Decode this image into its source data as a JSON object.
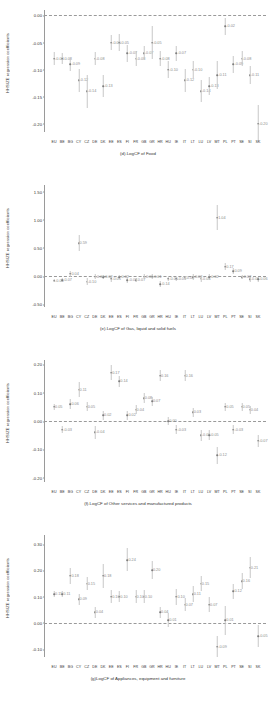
{
  "figure": {
    "ylabel": "HHSIZE regression coefficients",
    "countries": [
      "EU",
      "BE",
      "BG",
      "CY",
      "CZ",
      "DE",
      "DK",
      "EE",
      "ES",
      "FI",
      "FR",
      "GB",
      "GR",
      "HR",
      "HU",
      "IE",
      "IT",
      "LT",
      "LU",
      "LV",
      "MT",
      "PL",
      "PT",
      "SE",
      "SI",
      "SK"
    ]
  },
  "chart_data": [
    {
      "type": "scatter",
      "panel_id": "d",
      "title": "(d).LogCF of Food",
      "xlabel": "",
      "ylabel": "HHSIZE regression coefficients",
      "ylim": [
        -0.215,
        0.01
      ],
      "yticks": [
        "0.00",
        "-0.05",
        "-0.10",
        "-0.15",
        "-0.20"
      ],
      "ytickvals": [
        0.0,
        -0.05,
        -0.1,
        -0.15,
        -0.2
      ],
      "grid": false,
      "zero_reference": 0.0,
      "categories": [
        "EU",
        "BE",
        "BG",
        "CY",
        "CZ",
        "DE",
        "DK",
        "EE",
        "ES",
        "FI",
        "FR",
        "GB",
        "GR",
        "HR",
        "HU",
        "IE",
        "IT",
        "LT",
        "LU",
        "LV",
        "MT",
        "PL",
        "PT",
        "SE",
        "SI",
        "SK"
      ],
      "values": [
        -0.08,
        -0.08,
        -0.09,
        -0.12,
        -0.14,
        -0.08,
        -0.13,
        -0.05,
        -0.05,
        -0.07,
        -0.08,
        -0.07,
        -0.05,
        -0.08,
        -0.1,
        -0.07,
        -0.12,
        -0.1,
        -0.14,
        -0.13,
        -0.11,
        -0.02,
        -0.09,
        -0.08,
        -0.11,
        -0.2
      ],
      "errors": [
        0.012,
        0.01,
        0.012,
        0.022,
        0.03,
        0.012,
        0.02,
        0.014,
        0.016,
        0.016,
        0.014,
        0.013,
        0.03,
        0.014,
        0.016,
        0.014,
        0.022,
        0.016,
        0.02,
        0.016,
        0.026,
        0.016,
        0.016,
        0.014,
        0.016,
        0.034
      ]
    },
    {
      "type": "scatter",
      "panel_id": "e",
      "title": "(e).LogCF of Gas, liquid and solid fuels",
      "xlabel": "",
      "ylabel": "HHSIZE regression coefficients",
      "ylim": [
        -0.55,
        1.62
      ],
      "yticks": [
        "1.50",
        "1.00",
        "0.50",
        "0.00",
        "-0.50"
      ],
      "ytickvals": [
        1.5,
        1.0,
        0.5,
        0.0,
        -0.5
      ],
      "grid": false,
      "zero_reference": 0.0,
      "categories": [
        "EU",
        "BE",
        "BG",
        "CY",
        "CZ",
        "DE",
        "DK",
        "EE",
        "ES",
        "FI",
        "FR",
        "GB",
        "GR",
        "HR",
        "HU",
        "IE",
        "IT",
        "LT",
        "LU",
        "LV",
        "MT",
        "PL",
        "PT",
        "SE",
        "SI",
        "SK"
      ],
      "values": [
        -0.08,
        -0.07,
        0.04,
        0.59,
        -0.1,
        -0.01,
        -0.02,
        -0.05,
        -0.02,
        -0.07,
        -0.07,
        -0.01,
        -0.01,
        -0.14,
        -0.05,
        -0.05,
        -0.03,
        -0.02,
        -0.05,
        -0.02,
        1.04,
        0.17,
        0.09,
        -0.02,
        -0.06,
        -0.06
      ],
      "errors": [
        0.03,
        0.03,
        0.05,
        0.14,
        0.06,
        0.04,
        0.04,
        0.05,
        0.04,
        0.05,
        0.04,
        0.04,
        0.05,
        0.06,
        0.04,
        0.04,
        0.04,
        0.05,
        0.05,
        0.05,
        0.22,
        0.07,
        0.05,
        0.04,
        0.05,
        0.05
      ]
    },
    {
      "type": "scatter",
      "panel_id": "f",
      "title": "(f).LogCF of Other services and manufactured products",
      "xlabel": "",
      "ylabel": "HHSIZE regression coefficients",
      "ylim": [
        -0.215,
        0.215
      ],
      "yticks": [
        "0.20",
        "0.10",
        "0.00",
        "-0.10",
        "-0.20"
      ],
      "ytickvals": [
        0.2,
        0.1,
        0.0,
        -0.1,
        -0.2
      ],
      "grid": false,
      "zero_reference": 0.0,
      "categories": [
        "EU",
        "BE",
        "BG",
        "CY",
        "CZ",
        "DE",
        "DK",
        "EE",
        "ES",
        "FI",
        "FR",
        "GB",
        "GR",
        "HR",
        "HU",
        "IE",
        "IT",
        "LT",
        "LU",
        "LV",
        "MT",
        "PL",
        "PT",
        "SE",
        "SI",
        "SK"
      ],
      "values": [
        0.05,
        -0.03,
        0.06,
        0.11,
        0.05,
        -0.04,
        0.02,
        0.17,
        0.14,
        0.02,
        0.04,
        0.08,
        0.07,
        0.16,
        0.0,
        -0.03,
        0.16,
        0.03,
        -0.05,
        -0.05,
        -0.12,
        0.05,
        -0.03,
        0.05,
        0.04,
        -0.07
      ],
      "errors": [
        0.01,
        0.012,
        0.016,
        0.026,
        0.016,
        0.022,
        0.016,
        0.026,
        0.02,
        0.016,
        0.016,
        0.018,
        0.016,
        0.02,
        0.014,
        0.016,
        0.018,
        0.016,
        0.02,
        0.018,
        0.03,
        0.014,
        0.016,
        0.014,
        0.014,
        0.02
      ]
    },
    {
      "type": "scatter",
      "panel_id": "g",
      "title": "(g)LogCF of Appliances, equipment and furniture",
      "xlabel": "",
      "ylabel": "HHSIZE regression coefficients",
      "ylim": [
        -0.13,
        0.335
      ],
      "yticks": [
        "0.30",
        "0.20",
        "0.10",
        "0.00",
        "-0.10"
      ],
      "ytickvals": [
        0.3,
        0.2,
        0.1,
        0.0,
        -0.1
      ],
      "grid": false,
      "zero_reference": 0.0,
      "categories": [
        "EU",
        "BE",
        "BG",
        "CY",
        "CZ",
        "DE",
        "DK",
        "EE",
        "ES",
        "FI",
        "FR",
        "GB",
        "GR",
        "HR",
        "HU",
        "IE",
        "IT",
        "LT",
        "LU",
        "LV",
        "MT",
        "PL",
        "PT",
        "SE",
        "SI",
        "SK"
      ],
      "values": [
        0.11,
        0.11,
        0.18,
        0.09,
        0.15,
        0.04,
        0.18,
        0.1,
        0.1,
        0.24,
        0.1,
        0.1,
        0.2,
        0.04,
        0.01,
        0.1,
        0.07,
        0.11,
        0.15,
        0.07,
        -0.09,
        0.01,
        0.12,
        0.16,
        0.21,
        -0.05
      ],
      "errors": [
        0.012,
        0.013,
        0.03,
        0.02,
        0.026,
        0.022,
        0.046,
        0.024,
        0.022,
        0.044,
        0.026,
        0.024,
        0.034,
        0.022,
        0.026,
        0.03,
        0.026,
        0.03,
        0.03,
        0.03,
        0.04,
        0.056,
        0.028,
        0.03,
        0.04,
        0.042
      ]
    }
  ]
}
